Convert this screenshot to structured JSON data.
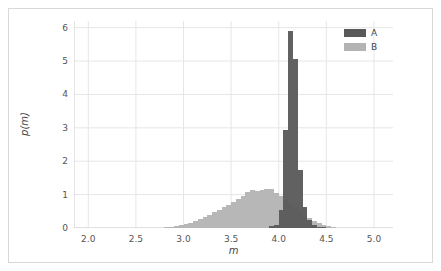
{
  "figure": {
    "background_color": "#ffffff",
    "frame_color": "#d8d8d8"
  },
  "legend": {
    "position": "upper right",
    "entries": [
      {
        "label": "A",
        "color": "#595959",
        "swatch_name": "legend-swatch-a"
      },
      {
        "label": "B",
        "color": "#b3b3b3",
        "swatch_name": "legend-swatch-b"
      }
    ]
  },
  "chart_data": {
    "type": "bar",
    "subtype": "histogram",
    "title": "",
    "xlabel": "m",
    "ylabel": "p(m)",
    "xlim": [
      1.85,
      5.2
    ],
    "ylim": [
      0,
      6.2
    ],
    "xticks": [
      2.0,
      2.5,
      3.0,
      3.5,
      4.0,
      4.5,
      5.0
    ],
    "xtick_labels": [
      "2.0",
      "2.5",
      "3.0",
      "3.5",
      "4.0",
      "4.5",
      "5.0"
    ],
    "yticks": [
      0,
      1,
      2,
      3,
      4,
      5,
      6
    ],
    "ytick_labels": [
      "0",
      "1",
      "2",
      "3",
      "4",
      "5",
      "6"
    ],
    "grid": true,
    "grid_color": "#e6e6e6",
    "bin_width": 0.05,
    "series": [
      {
        "name": "A",
        "color": "#595959",
        "opacity": 0.95,
        "bin_left_edges": [
          3.9,
          3.95,
          4.0,
          4.05,
          4.1,
          4.15,
          4.2,
          4.25,
          4.3,
          4.35,
          4.4,
          4.45
        ],
        "values": [
          0.05,
          0.1,
          0.55,
          2.95,
          5.9,
          5.05,
          1.75,
          0.62,
          0.25,
          0.1,
          0.04,
          0.02
        ]
      },
      {
        "name": "B",
        "color": "#b3b3b3",
        "opacity": 0.95,
        "bin_left_edges": [
          2.8,
          2.85,
          2.9,
          2.95,
          3.0,
          3.05,
          3.1,
          3.15,
          3.2,
          3.25,
          3.3,
          3.35,
          3.4,
          3.45,
          3.5,
          3.55,
          3.6,
          3.65,
          3.7,
          3.75,
          3.8,
          3.85,
          3.9,
          3.95,
          4.0,
          4.05,
          4.1,
          4.15,
          4.2,
          4.25,
          4.3,
          4.35,
          4.4,
          4.45,
          4.5,
          4.55
        ],
        "values": [
          0.02,
          0.04,
          0.06,
          0.09,
          0.12,
          0.16,
          0.2,
          0.26,
          0.33,
          0.4,
          0.48,
          0.53,
          0.62,
          0.7,
          0.78,
          0.86,
          0.96,
          1.08,
          1.13,
          1.1,
          1.14,
          1.18,
          1.16,
          1.05,
          0.95,
          0.85,
          0.73,
          0.62,
          0.52,
          0.4,
          0.3,
          0.22,
          0.15,
          0.1,
          0.06,
          0.03
        ]
      }
    ]
  }
}
